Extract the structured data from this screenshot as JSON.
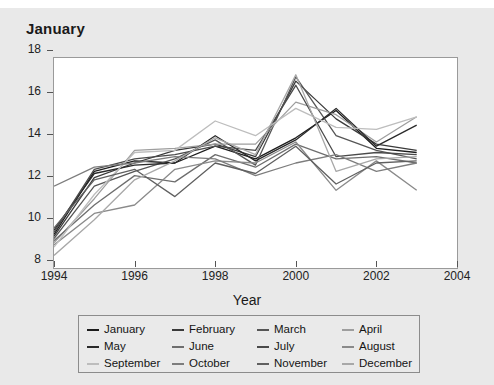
{
  "chart_data": {
    "type": "line",
    "title": "January",
    "xlabel": "Year",
    "ylabel": "",
    "xlim": [
      1994,
      2004
    ],
    "ylim": [
      8,
      18
    ],
    "xticks": [
      1994,
      1996,
      1998,
      2000,
      2002,
      2004
    ],
    "yticks": [
      8,
      10,
      12,
      14,
      16,
      18
    ],
    "grid": false,
    "legend_position": "bottom",
    "x": [
      1994,
      1995,
      1996,
      1997,
      1998,
      1999,
      2000,
      2001,
      2002,
      2003
    ],
    "series": [
      {
        "name": "January",
        "color": "#1c1c1c",
        "values": [
          9.6,
          12.6,
          13.1,
          13.0,
          13.8,
          13.2,
          14.2,
          15.5,
          13.7,
          13.5
        ]
      },
      {
        "name": "February",
        "color": "#3a3a3a",
        "values": [
          9.5,
          12.3,
          13.0,
          13.6,
          13.9,
          13.3,
          16.9,
          15.1,
          13.9,
          13.6
        ]
      },
      {
        "name": "March",
        "color": "#565656",
        "values": [
          9.4,
          11.9,
          12.6,
          13.2,
          14.1,
          12.9,
          17.1,
          14.3,
          13.6,
          13.2
        ]
      },
      {
        "name": "April",
        "color": "#9e9e9e",
        "values": [
          9.2,
          11.3,
          13.6,
          13.7,
          13.9,
          13.9,
          15.9,
          15.3,
          14.0,
          15.2
        ]
      },
      {
        "name": "May",
        "color": "#2a2a2a",
        "values": [
          9.8,
          12.5,
          12.9,
          13.0,
          14.3,
          13.1,
          14.1,
          15.6,
          13.8,
          14.8
        ]
      },
      {
        "name": "June",
        "color": "#6e6e6e",
        "values": [
          9.3,
          11.0,
          12.4,
          12.1,
          13.4,
          12.8,
          13.9,
          13.2,
          13.3,
          13.0
        ]
      },
      {
        "name": "July",
        "color": "#4a4a4a",
        "values": [
          9.7,
          12.7,
          13.2,
          13.4,
          13.8,
          13.6,
          16.7,
          13.3,
          13.5,
          13.4
        ]
      },
      {
        "name": "August",
        "color": "#8a8a8a",
        "values": [
          9.1,
          10.6,
          11.0,
          12.7,
          13.1,
          13.0,
          14.0,
          11.7,
          13.1,
          11.7
        ]
      },
      {
        "name": "September",
        "color": "#bdbdbd",
        "values": [
          9.0,
          11.5,
          13.5,
          13.6,
          15.0,
          14.3,
          15.6,
          14.7,
          14.6,
          15.2
        ]
      },
      {
        "name": "October",
        "color": "#7d7d7d",
        "values": [
          11.9,
          12.8,
          13.0,
          13.3,
          13.2,
          12.4,
          13.0,
          13.4,
          12.6,
          13.0
        ]
      },
      {
        "name": "November",
        "color": "#606060",
        "values": [
          9.9,
          12.2,
          12.7,
          11.4,
          13.0,
          12.5,
          13.8,
          12.0,
          13.0,
          13.1
        ]
      },
      {
        "name": "December",
        "color": "#a8a8a8",
        "values": [
          8.6,
          10.3,
          12.2,
          13.1,
          14.2,
          13.4,
          17.2,
          12.6,
          13.2,
          13.3
        ]
      }
    ]
  },
  "legend": {
    "entries": [
      {
        "label": "January"
      },
      {
        "label": "February"
      },
      {
        "label": "March"
      },
      {
        "label": "April"
      },
      {
        "label": "May"
      },
      {
        "label": "June"
      },
      {
        "label": "July"
      },
      {
        "label": "August"
      },
      {
        "label": "September"
      },
      {
        "label": "October"
      },
      {
        "label": "November"
      },
      {
        "label": "December"
      }
    ]
  }
}
